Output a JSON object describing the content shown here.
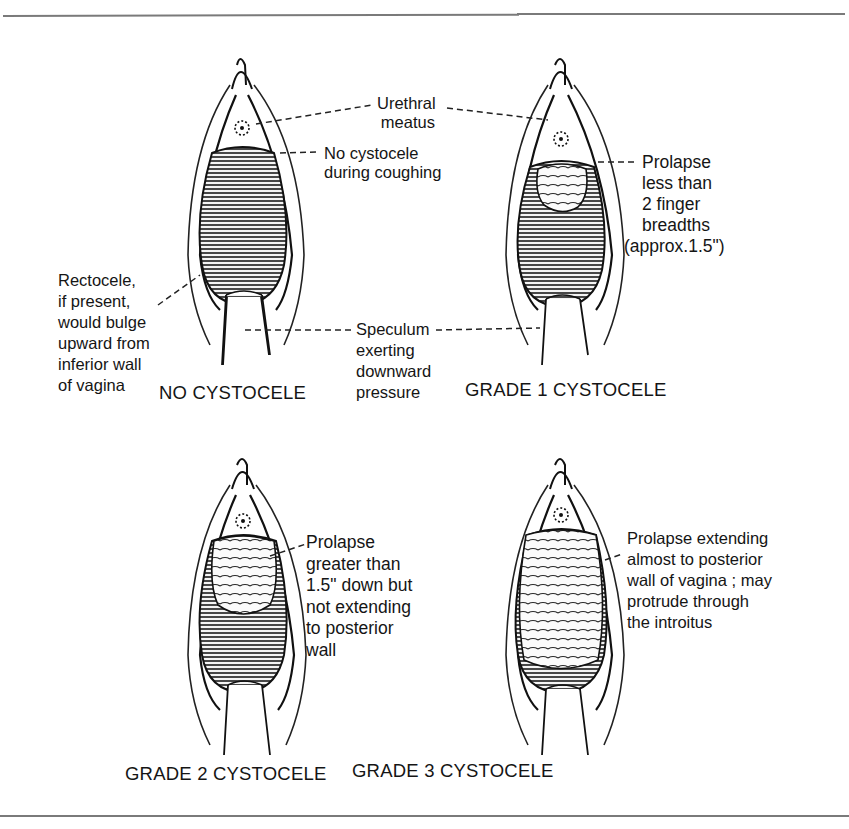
{
  "figure": {
    "panels": [
      {
        "id": "no-cystocele",
        "caption": "NO CYSTOCELE",
        "annotations": {
          "rectocele": [
            "Rectocele,",
            "if present,",
            "would bulge",
            "upward from",
            "inferior wall",
            "of vagina"
          ]
        }
      },
      {
        "id": "grade-1",
        "caption": "GRADE 1 CYSTOCELE",
        "annotations": {
          "prolapse": [
            "Prolapse",
            "less than",
            "2 finger",
            "breadths",
            "(approx.1.5\")"
          ]
        }
      },
      {
        "id": "grade-2",
        "caption": "GRADE 2 CYSTOCELE",
        "annotations": {
          "prolapse": [
            "Prolapse",
            "greater than",
            "1.5\" down but",
            "not extending",
            "to posterior",
            "wall"
          ]
        }
      },
      {
        "id": "grade-3",
        "caption": "GRADE 3 CYSTOCELE",
        "annotations": {
          "prolapse": [
            "Prolapse extending",
            "almost to posterior",
            "wall of vagina ; may",
            "protrude through",
            "the introitus"
          ]
        }
      }
    ],
    "shared_labels": {
      "urethral_meatus": [
        "Urethral",
        "meatus"
      ],
      "no_cystocele_coughing": [
        "No cystocele",
        "during coughing"
      ],
      "speculum": [
        "Speculum",
        "exerting",
        "downward",
        "pressure"
      ]
    }
  }
}
